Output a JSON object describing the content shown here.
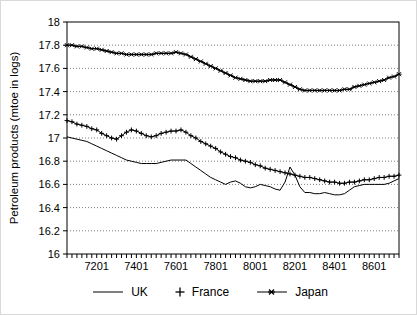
{
  "chart_data": {
    "type": "line",
    "title": "",
    "xlabel": "",
    "ylabel": "Petroleum products (mtoe in logs)",
    "ylim": [
      16,
      18
    ],
    "yticks": [
      "16",
      "16.2",
      "16.4",
      "16.6",
      "16.8",
      "17",
      "17.2",
      "17.4",
      "17.6",
      "17.8",
      "18"
    ],
    "grid": {
      "horizontal": "dotted",
      "color": "#7f7f7f"
    },
    "legend_position": "bottom",
    "colors": {
      "series": "#000000",
      "background": "#ffffff"
    },
    "x_quarters": [
      "7003",
      "7004",
      "7101",
      "7102",
      "7103",
      "7104",
      "7201",
      "7202",
      "7203",
      "7204",
      "7301",
      "7302",
      "7303",
      "7304",
      "7401",
      "7402",
      "7403",
      "7404",
      "7501",
      "7502",
      "7503",
      "7504",
      "7601",
      "7602",
      "7603",
      "7604",
      "7701",
      "7702",
      "7703",
      "7704",
      "7801",
      "7802",
      "7803",
      "7804",
      "7901",
      "7902",
      "7903",
      "7904",
      "8001",
      "8002",
      "8003",
      "8004",
      "8101",
      "8102",
      "8103",
      "8104",
      "8201",
      "8202",
      "8203",
      "8204",
      "8301",
      "8302",
      "8303",
      "8304",
      "8401",
      "8402",
      "8403",
      "8404",
      "8501",
      "8502",
      "8503",
      "8504",
      "8601",
      "8602",
      "8603",
      "8604",
      "8701",
      "8702"
    ],
    "xtick_labels": [
      {
        "index": 6,
        "label": "7201"
      },
      {
        "index": 14,
        "label": "7401"
      },
      {
        "index": 22,
        "label": "7601"
      },
      {
        "index": 30,
        "label": "7801"
      },
      {
        "index": 38,
        "label": "8001"
      },
      {
        "index": 46,
        "label": "8201"
      },
      {
        "index": 54,
        "label": "8401"
      },
      {
        "index": 62,
        "label": "8601"
      }
    ],
    "series": [
      {
        "name": "UK",
        "marker": "none",
        "values": [
          17.01,
          17.0,
          16.99,
          16.98,
          16.97,
          16.95,
          16.93,
          16.91,
          16.89,
          16.87,
          16.85,
          16.83,
          16.81,
          16.8,
          16.79,
          16.78,
          16.78,
          16.78,
          16.78,
          16.79,
          16.8,
          16.81,
          16.81,
          16.81,
          16.81,
          16.78,
          16.75,
          16.72,
          16.69,
          16.66,
          16.64,
          16.62,
          16.6,
          16.62,
          16.63,
          16.61,
          16.58,
          16.57,
          16.58,
          16.6,
          16.59,
          16.58,
          16.56,
          16.55,
          16.62,
          16.75,
          16.68,
          16.58,
          16.53,
          16.53,
          16.52,
          16.52,
          16.53,
          16.52,
          16.51,
          16.51,
          16.52,
          16.55,
          16.58,
          16.59,
          16.6,
          16.6,
          16.6,
          16.6,
          16.6,
          16.61,
          16.63,
          16.65
        ]
      },
      {
        "name": "France",
        "marker": "plus",
        "values": [
          17.15,
          17.14,
          17.12,
          17.11,
          17.1,
          17.08,
          17.07,
          17.04,
          17.02,
          17.0,
          16.99,
          17.02,
          17.05,
          17.07,
          17.06,
          17.04,
          17.02,
          17.01,
          17.02,
          17.04,
          17.05,
          17.06,
          17.06,
          17.07,
          17.05,
          17.02,
          17.0,
          16.97,
          16.95,
          16.93,
          16.91,
          16.88,
          16.86,
          16.84,
          16.83,
          16.81,
          16.8,
          16.79,
          16.77,
          16.76,
          16.74,
          16.73,
          16.72,
          16.71,
          16.7,
          16.69,
          16.68,
          16.67,
          16.66,
          16.66,
          16.65,
          16.64,
          16.63,
          16.62,
          16.62,
          16.61,
          16.61,
          16.62,
          16.62,
          16.63,
          16.64,
          16.64,
          16.65,
          16.66,
          16.66,
          16.67,
          16.67,
          16.68
        ]
      },
      {
        "name": "Japan",
        "marker": "star",
        "values": [
          17.8,
          17.8,
          17.79,
          17.79,
          17.78,
          17.77,
          17.77,
          17.76,
          17.75,
          17.74,
          17.73,
          17.73,
          17.72,
          17.72,
          17.72,
          17.72,
          17.72,
          17.72,
          17.73,
          17.73,
          17.73,
          17.73,
          17.74,
          17.73,
          17.72,
          17.7,
          17.68,
          17.66,
          17.64,
          17.62,
          17.6,
          17.58,
          17.56,
          17.54,
          17.52,
          17.51,
          17.5,
          17.49,
          17.49,
          17.49,
          17.49,
          17.5,
          17.5,
          17.5,
          17.48,
          17.46,
          17.44,
          17.42,
          17.41,
          17.41,
          17.41,
          17.41,
          17.41,
          17.41,
          17.41,
          17.41,
          17.42,
          17.42,
          17.44,
          17.45,
          17.46,
          17.47,
          17.48,
          17.49,
          17.5,
          17.52,
          17.53,
          17.55
        ]
      }
    ]
  }
}
